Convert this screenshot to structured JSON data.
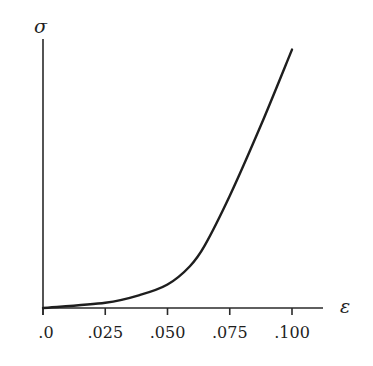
{
  "chart_data": {
    "type": "line",
    "title": "",
    "xlabel": "ε",
    "ylabel": "σ",
    "xlim": [
      0,
      0.11
    ],
    "x_ticks": [
      0,
      0.025,
      0.05,
      0.075,
      0.1
    ],
    "x_tick_labels": [
      ".0",
      ".025",
      ".050",
      ".075",
      ".100"
    ],
    "y_ticks": [],
    "grid": false,
    "legend": null,
    "series": [
      {
        "name": "stress-strain curve",
        "x": [
          0.0,
          0.025,
          0.039,
          0.05,
          0.059,
          0.065,
          0.075,
          0.0875,
          0.1
        ],
        "y_relative": [
          0.0,
          0.02,
          0.05,
          0.09,
          0.16,
          0.24,
          0.43,
          0.7,
          0.99
        ]
      }
    ],
    "annotations": []
  },
  "layout": {
    "origin_px": [
      43,
      308
    ],
    "x_px_per_unit": 2490,
    "y_top_px": 39,
    "x_axis_end_px": 323,
    "y_axis_top_px": 39
  }
}
